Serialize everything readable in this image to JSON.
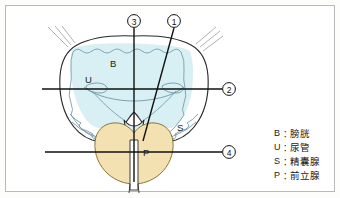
{
  "figure": {
    "background_color": "#ffffff",
    "frame_color": "#b9b9bd",
    "colors": {
      "bladder_fill": "#d7eef2",
      "bladder_outline": "#6b93a3",
      "organ_outline": "#2b2b2b",
      "prostate_fill": "#f2e0b0",
      "prostate_outline": "#8a7434",
      "callout_line": "#111111",
      "fringe_line": "#8f8f93",
      "label_text": "#1a1a1a"
    },
    "organ_labels": [
      {
        "id": "B",
        "text": "B",
        "x": 110,
        "y": 67
      },
      {
        "id": "U",
        "text": "U",
        "x": 85,
        "y": 83
      },
      {
        "id": "S",
        "text": "S",
        "x": 177,
        "y": 131
      },
      {
        "id": "P",
        "text": "P",
        "x": 143,
        "y": 156
      }
    ],
    "callouts": [
      {
        "id": "1",
        "label": "1",
        "circle_x": 174,
        "circle_y": 21,
        "type": "diagonal-line",
        "end_x": 143,
        "end_y": 140
      },
      {
        "id": "2",
        "label": "2",
        "circle_x": 229,
        "circle_y": 89,
        "type": "horizontal-line",
        "end_x": 42,
        "end_y": 89
      },
      {
        "id": "3",
        "label": "3",
        "circle_x": 134,
        "circle_y": 21,
        "type": "vertical-line",
        "end_x": 134,
        "end_y": 182
      },
      {
        "id": "4",
        "label": "4",
        "circle_x": 229,
        "circle_y": 152,
        "type": "horizontal-line",
        "end_x": 45,
        "end_y": 152
      }
    ]
  },
  "legend": {
    "separator": "：",
    "items": [
      {
        "key": "B",
        "term": "膀胱"
      },
      {
        "key": "U",
        "term": "尿管"
      },
      {
        "key": "S",
        "term": "精囊腺"
      },
      {
        "key": "P",
        "term": "前立腺"
      }
    ]
  }
}
